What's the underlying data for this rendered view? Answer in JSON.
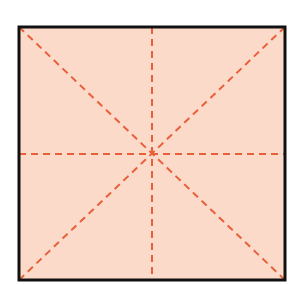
{
  "diagram": {
    "shape": "square",
    "description": "Square with dashed lines of symmetry",
    "colors": {
      "fill": "#fcdaca",
      "border": "#111111",
      "dash": "#e8603a",
      "background": "#ffffff"
    },
    "square": {
      "x": 19,
      "y": 27,
      "size": 266,
      "border_width": 3
    },
    "symmetry_lines": [
      {
        "name": "vertical",
        "x1": 152,
        "y1": 27,
        "x2": 152,
        "y2": 293
      },
      {
        "name": "horizontal",
        "x1": 19,
        "y1": 154,
        "x2": 285,
        "y2": 154
      },
      {
        "name": "diagonal-main",
        "x1": 19,
        "y1": 27,
        "x2": 285,
        "y2": 280
      },
      {
        "name": "diagonal-anti",
        "x1": 285,
        "y1": 27,
        "x2": 19,
        "y2": 280
      }
    ],
    "dash_pattern": "7 5",
    "line_count": 4
  }
}
